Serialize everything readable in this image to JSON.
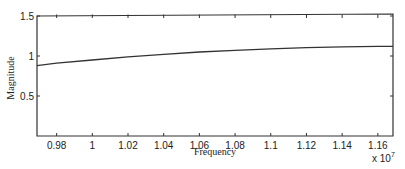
{
  "chart_data": {
    "type": "line",
    "title": "",
    "xlabel": "Frequency",
    "ylabel": "Magnitude",
    "x_multiplier_label": "x 10",
    "x_multiplier_exponent": "7",
    "xlim": [
      0.969,
      1.1685
    ],
    "ylim": [
      0,
      1.5
    ],
    "grid": false,
    "legend": null,
    "x_ticks": [
      0.98,
      1,
      1.02,
      1.04,
      1.06,
      1.08,
      1.1,
      1.12,
      1.14,
      1.16
    ],
    "x_tick_labels": [
      "0.98",
      "1",
      "1.02",
      "1.04",
      "1.06",
      "1.08",
      "1.1",
      "1.12",
      "1.14",
      "1.16"
    ],
    "y_ticks": [
      0.5,
      1,
      1.5
    ],
    "y_tick_labels": [
      "0.5",
      "1",
      "1.5"
    ],
    "series": [
      {
        "name": "Magnitude response",
        "color": "#333333",
        "x": [
          0.969,
          0.98,
          1.0,
          1.02,
          1.04,
          1.06,
          1.08,
          1.1,
          1.12,
          1.14,
          1.16,
          1.1685
        ],
        "y": [
          0.88,
          0.91,
          0.95,
          0.99,
          1.02,
          1.05,
          1.07,
          1.09,
          1.105,
          1.115,
          1.12,
          1.12
        ]
      }
    ]
  }
}
